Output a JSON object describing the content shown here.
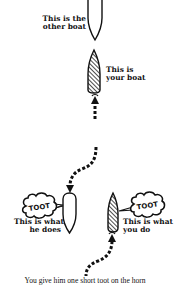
{
  "diagram": {
    "type": "boating-sound-signal-illustration",
    "top_scene": {
      "other_boat_label": [
        "This is the",
        "other boat"
      ],
      "your_boat_label": [
        "This is",
        "your boat"
      ],
      "your_boat_direction": "up"
    },
    "bottom_scene": {
      "other_boat": {
        "signal": "TOOT",
        "label": [
          "This is what",
          "he does"
        ]
      },
      "your_boat": {
        "signal": "TOOT",
        "label": [
          "This is what",
          "you do"
        ]
      }
    },
    "caption": "You give him one short toot on the horn"
  },
  "colors": {
    "ink": "#111111",
    "background": "#ffffff"
  },
  "icons": {
    "other_boat": "white-hull-outline",
    "your_boat": "hatched-hull",
    "speech": "cloud-bubble",
    "path": "dashed-arrow"
  }
}
